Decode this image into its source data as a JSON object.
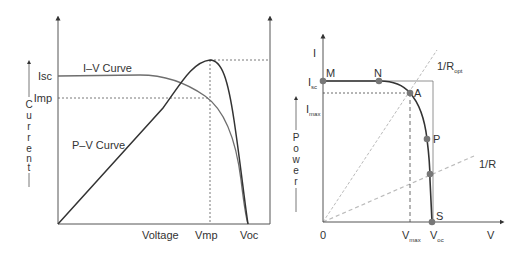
{
  "left_figure": {
    "y_axis_label": "Current",
    "y_axis_label_letters": [
      "C",
      "u",
      "r",
      "r",
      "e",
      "n",
      "t"
    ],
    "right_axis_label": "Power",
    "right_axis_label_letters": [
      "P",
      "o",
      "w",
      "e",
      "r"
    ],
    "y_ticks": {
      "isc": "Isc",
      "imp": "Imp"
    },
    "x_ticks": {
      "voltage": "Voltage",
      "vmp": "Vmp",
      "voc": "Voc"
    },
    "curve_labels": {
      "iv": "I–V Curve",
      "pv": "P–V Curve"
    }
  },
  "right_figure": {
    "y_axis_label": "I",
    "x_axis_label": "V",
    "origin_label": "0",
    "y_ticks": {
      "isc_main": "I",
      "isc_sub": "sc",
      "imax_main": "I",
      "imax_sub": "max"
    },
    "x_ticks": {
      "vmax_main": "V",
      "vmax_sub": "max",
      "voc_main": "V",
      "voc_sub": "oc"
    },
    "points": {
      "m": "M",
      "n": "N",
      "a": "A",
      "p": "P",
      "s": "S"
    },
    "load_lines": {
      "ropt_main": "1/R",
      "ropt_sub": "opt",
      "r": "1/R"
    }
  },
  "colors": {
    "axis": "#555555",
    "iv_curve": "#6e6e6e",
    "pv_curve": "#333333",
    "dashed": "#555555",
    "load_line": "#bbbbbb",
    "point": "#777777"
  }
}
